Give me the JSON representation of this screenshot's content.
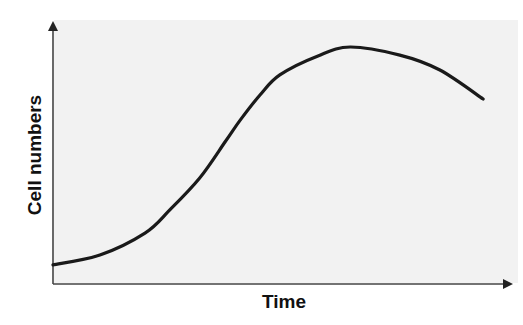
{
  "chart_data": {
    "type": "line",
    "title": "",
    "xlabel": "Time",
    "ylabel": "Cell numbers",
    "grid": false,
    "legend": null,
    "axis_ticks": false,
    "xlim": [
      0,
      100
    ],
    "ylim": [
      0,
      100
    ],
    "series": [
      {
        "name": "Cell growth curve",
        "x": [
          0,
          10.2,
          20.0,
          25.4,
          31.9,
          37.4,
          40.7,
          45.0,
          49.3,
          57.6,
          64.6,
          75.4,
          84.1,
          93.5
        ],
        "y": [
          7.3,
          11.1,
          19.5,
          28.4,
          40.6,
          54.4,
          62.8,
          72.4,
          80.1,
          87.4,
          90.8,
          87.7,
          82.0,
          70.9
        ]
      }
    ],
    "colors": {
      "background": "#f2f2f2",
      "line": "#1a1a1a",
      "axis": "#444444"
    }
  },
  "labels": {
    "x_axis": "Time",
    "y_axis": "Cell numbers"
  }
}
